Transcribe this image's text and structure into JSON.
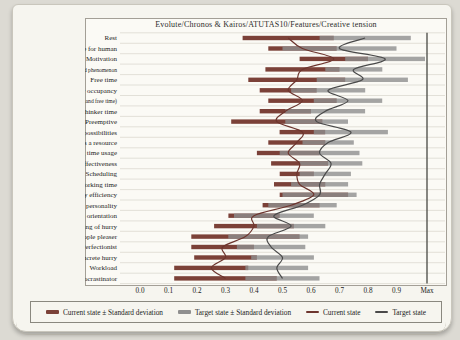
{
  "chart_data": {
    "type": "bar",
    "subtype": "horizontal-range-bars-with-smoothed-mean-lines",
    "title": "Evolute/Chronos & Kairos/ATUTAS10/Features/Creative tension",
    "categories": [
      "Rest",
      "Time's value for human",
      "Motivation",
      "Time as an undominated phenomenon",
      "Free time",
      "Productivity occupancy",
      "Balance in life (between work and free time)",
      "Thinker time",
      "Preemptive",
      "Development possibilities",
      "Time as a resource",
      "Recording time usage",
      "Productivity effectiveness",
      "Scheduling",
      "Working time",
      "Productivity efficiency",
      "Optimistic planning personality",
      "Present orientation",
      "Abstract feeling of hurry",
      "People pleaser",
      "Perfectionist",
      "Concrete hurry",
      "Workload",
      "Procrastinator"
    ],
    "series": [
      {
        "name": "Current state",
        "means": [
          0.52,
          0.57,
          0.68,
          0.57,
          0.55,
          0.52,
          0.57,
          0.51,
          0.48,
          0.57,
          0.55,
          0.52,
          0.56,
          0.55,
          0.56,
          0.61,
          0.53,
          0.4,
          0.4,
          0.37,
          0.29,
          0.3,
          0.25,
          0.3
        ],
        "std_devs": [
          0.16,
          0.12,
          0.12,
          0.13,
          0.17,
          0.1,
          0.12,
          0.09,
          0.16,
          0.08,
          0.1,
          0.11,
          0.1,
          0.06,
          0.09,
          0.12,
          0.1,
          0.09,
          0.14,
          0.19,
          0.11,
          0.11,
          0.13,
          0.18
        ]
      },
      {
        "name": "Target state",
        "means": [
          0.79,
          0.7,
          0.86,
          0.75,
          0.78,
          0.66,
          0.73,
          0.65,
          0.62,
          0.74,
          0.66,
          0.63,
          0.67,
          0.65,
          0.63,
          0.63,
          0.57,
          0.47,
          0.53,
          0.45,
          0.46,
          0.5,
          0.48,
          0.5
        ],
        "std_devs": [
          0.16,
          0.2,
          0.14,
          0.1,
          0.16,
          0.13,
          0.12,
          0.14,
          0.11,
          0.13,
          0.09,
          0.14,
          0.11,
          0.09,
          0.1,
          0.13,
          0.12,
          0.14,
          0.12,
          0.14,
          0.12,
          0.11,
          0.11,
          0.13
        ]
      }
    ],
    "x_axis": {
      "min": 0.0,
      "max": 1.0,
      "ticks": [
        "0.0",
        "0.1",
        "0.2",
        "0.3",
        "0.4",
        "0.5",
        "0.6",
        "0.7",
        "0.8",
        "0.9",
        "Max"
      ],
      "grid": "horizontal-row-separators"
    },
    "legend": {
      "position": "bottom",
      "items": [
        "Current state ± Standard deviation",
        "Target state ± Standard deviation",
        "Current state",
        "Target state"
      ]
    },
    "colors": {
      "current_bar": "#7b4138",
      "target_bar": "#8f8f8f",
      "current_line": "#6d352e",
      "target_line": "#4a4a4a",
      "gridline": "#dcd9d0",
      "max_spine": "#555550",
      "text": "#222222"
    }
  }
}
